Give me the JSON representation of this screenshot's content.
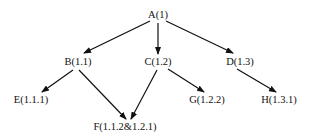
{
  "diagram": {
    "type": "tree",
    "nodes": [
      {
        "id": "A",
        "label": "A(1)",
        "x": 158,
        "y": 15
      },
      {
        "id": "B",
        "label": "B(1.1)",
        "x": 78,
        "y": 62
      },
      {
        "id": "C",
        "label": "C(1.2)",
        "x": 158,
        "y": 62
      },
      {
        "id": "D",
        "label": "D(1.3)",
        "x": 240,
        "y": 62
      },
      {
        "id": "E",
        "label": "E(1.1.1)",
        "x": 31,
        "y": 100
      },
      {
        "id": "F",
        "label": "F(1.1.2&1.2.1)",
        "x": 125,
        "y": 127
      },
      {
        "id": "G",
        "label": "G(1.2.2)",
        "x": 207,
        "y": 100
      },
      {
        "id": "H",
        "label": "H(1.3.1)",
        "x": 279,
        "y": 100
      }
    ],
    "edges": [
      {
        "from": "A",
        "to": "B",
        "x1": 150,
        "y1": 21,
        "x2": 84,
        "y2": 53
      },
      {
        "from": "A",
        "to": "C",
        "x1": 158,
        "y1": 23,
        "x2": 158,
        "y2": 54
      },
      {
        "from": "A",
        "to": "D",
        "x1": 166,
        "y1": 21,
        "x2": 233,
        "y2": 53
      },
      {
        "from": "B",
        "to": "E",
        "x1": 73,
        "y1": 70,
        "x2": 42,
        "y2": 92
      },
      {
        "from": "B",
        "to": "F",
        "x1": 79,
        "y1": 70,
        "x2": 126,
        "y2": 119
      },
      {
        "from": "C",
        "to": "F",
        "x1": 157,
        "y1": 70,
        "x2": 131,
        "y2": 119
      },
      {
        "from": "C",
        "to": "G",
        "x1": 168,
        "y1": 69,
        "x2": 204,
        "y2": 92
      },
      {
        "from": "D",
        "to": "H",
        "x1": 237,
        "y1": 69,
        "x2": 276,
        "y2": 92
      }
    ],
    "colors": {
      "line": "#111111",
      "text": "#111111",
      "background": "#ffffff"
    }
  }
}
